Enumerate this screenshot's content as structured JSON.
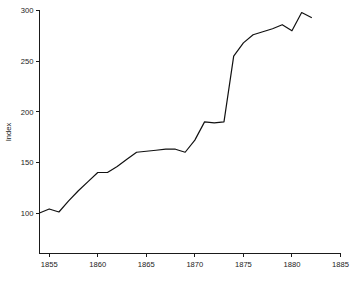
{
  "chart_data": {
    "type": "line",
    "title": "",
    "xlabel": "",
    "ylabel": "Index",
    "xlim": [
      1854,
      1885
    ],
    "ylim": [
      60,
      300
    ],
    "grid": false,
    "legend": null,
    "x_ticks": [
      1855,
      1860,
      1865,
      1870,
      1875,
      1880,
      1885
    ],
    "y_ticks": [
      100,
      150,
      200,
      250,
      300
    ],
    "x": [
      1854,
      1855,
      1856,
      1857,
      1858,
      1859,
      1860,
      1861,
      1862,
      1863,
      1864,
      1865,
      1866,
      1867,
      1868,
      1869,
      1870,
      1871,
      1872,
      1873,
      1874,
      1875,
      1876,
      1877,
      1878,
      1879,
      1880,
      1881,
      1882
    ],
    "values": [
      100,
      104,
      101,
      112,
      122,
      131,
      140,
      140,
      146,
      153,
      160,
      161,
      162,
      163,
      163,
      160,
      172,
      190,
      189,
      190,
      255,
      268,
      276,
      279,
      282,
      286,
      280,
      298,
      293
    ],
    "series": [
      {
        "name": "Index",
        "values": [
          100,
          104,
          101,
          112,
          122,
          131,
          140,
          140,
          146,
          153,
          160,
          161,
          162,
          163,
          163,
          160,
          172,
          190,
          189,
          190,
          255,
          268,
          276,
          279,
          282,
          286,
          280,
          298,
          293
        ]
      }
    ]
  },
  "axes": {
    "y_label": "Index",
    "y_tick_labels": [
      "300",
      "250",
      "200",
      "150",
      "100"
    ],
    "x_tick_labels": [
      "1855",
      "1860",
      "1865",
      "1870",
      "1875",
      "1880",
      "1885"
    ]
  },
  "colors": {
    "line": "#111111",
    "axis": "#1a1a1a",
    "background": "#ffffff"
  }
}
